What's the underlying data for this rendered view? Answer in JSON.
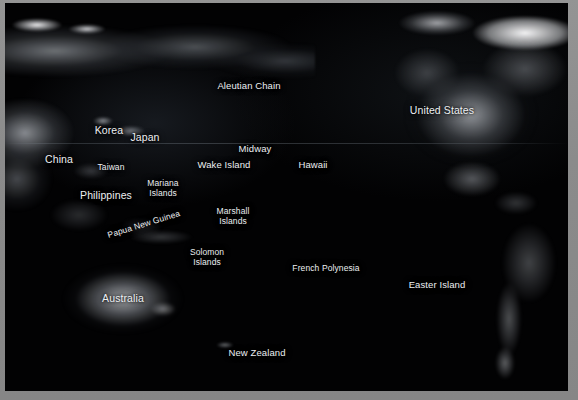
{
  "window": {
    "frame_color": "#8d8d8d",
    "map_background_color": "#020203",
    "label_color": "#eceff2"
  },
  "map": {
    "type": "satellite-night-lights",
    "region": "Pacific Ocean",
    "graticule_visible": true,
    "labels": [
      {
        "name": "aleutian-chain",
        "text": "Aleutian Chain",
        "x": 244,
        "y": 78,
        "size": "md",
        "rotate": 0
      },
      {
        "name": "united-states",
        "text": "United States",
        "x": 437,
        "y": 101,
        "size": "lg",
        "rotate": 0
      },
      {
        "name": "korea",
        "text": "Korea",
        "x": 104,
        "y": 121,
        "size": "lg",
        "rotate": 0
      },
      {
        "name": "japan",
        "text": "Japan",
        "x": 140,
        "y": 128,
        "size": "lg",
        "rotate": 0
      },
      {
        "name": "midway",
        "text": "Midway",
        "x": 250,
        "y": 141,
        "size": "md",
        "rotate": 0
      },
      {
        "name": "china",
        "text": "China",
        "x": 54,
        "y": 150,
        "size": "lg",
        "rotate": 0
      },
      {
        "name": "wake-island",
        "text": "Wake Island",
        "x": 219,
        "y": 157,
        "size": "md",
        "rotate": 0
      },
      {
        "name": "hawaii",
        "text": "Hawaii",
        "x": 308,
        "y": 157,
        "size": "md",
        "rotate": 0
      },
      {
        "name": "taiwan",
        "text": "Taiwan",
        "x": 106,
        "y": 160,
        "size": "sm",
        "rotate": 0
      },
      {
        "name": "mariana-islands",
        "text": "Mariana\nIslands",
        "x": 158,
        "y": 176,
        "size": "sm",
        "rotate": 0
      },
      {
        "name": "philippines",
        "text": "Philippines",
        "x": 101,
        "y": 186,
        "size": "lg",
        "rotate": 0
      },
      {
        "name": "marshall-islands",
        "text": "Marshall\nIslands",
        "x": 228,
        "y": 204,
        "size": "sm",
        "rotate": 0
      },
      {
        "name": "papua-new-guinea",
        "text": "Papua New Guinea",
        "x": 103,
        "y": 228,
        "size": "sm",
        "rotate": -17
      },
      {
        "name": "solomon-islands",
        "text": "Solomon\nIslands",
        "x": 202,
        "y": 245,
        "size": "sm",
        "rotate": 0
      },
      {
        "name": "french-polynesia",
        "text": "French Polynesia",
        "x": 321,
        "y": 261,
        "size": "sm",
        "rotate": 0
      },
      {
        "name": "easter-island",
        "text": "Easter Island",
        "x": 432,
        "y": 277,
        "size": "md",
        "rotate": 0
      },
      {
        "name": "australia",
        "text": "Australia",
        "x": 118,
        "y": 289,
        "size": "lg",
        "rotate": 0
      },
      {
        "name": "new-zealand",
        "text": "New Zealand",
        "x": 252,
        "y": 345,
        "size": "md",
        "rotate": 0
      }
    ]
  }
}
